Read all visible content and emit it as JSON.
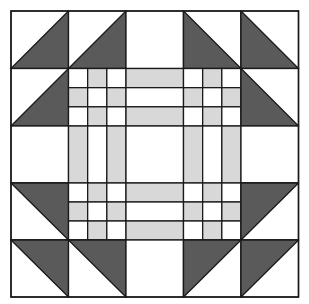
{
  "diagram": {
    "type": "quilt-block",
    "grid": {
      "x": [
        11,
        68.5,
        126,
        183.5,
        241,
        298.5
      ],
      "y": [
        11,
        68.5,
        126,
        183,
        240,
        297
      ]
    },
    "colors": {
      "dark": "#5a5a5a",
      "light": "#d8d8d8",
      "white": "#ffffff",
      "line": "#1a1a1a"
    },
    "cells": [
      [
        "hst-br",
        "hst-br",
        "white",
        "hst-bl",
        "hst-bl"
      ],
      [
        "hst-br",
        "ninepatch",
        "rail-h",
        "ninepatch",
        "hst-bl"
      ],
      [
        "white",
        "rail-v",
        "white",
        "rail-v",
        "white"
      ],
      [
        "hst-tr",
        "ninepatch",
        "rail-h",
        "ninepatch",
        "hst-tl"
      ],
      [
        "hst-tr",
        "hst-tr",
        "white",
        "hst-tl",
        "hst-tl"
      ]
    ],
    "ninepatch_pattern": [
      [
        "white",
        "light",
        "white"
      ],
      [
        "light",
        "white",
        "light"
      ],
      [
        "white",
        "light",
        "white"
      ]
    ],
    "rail_pattern": [
      "light",
      "white",
      "light"
    ]
  }
}
